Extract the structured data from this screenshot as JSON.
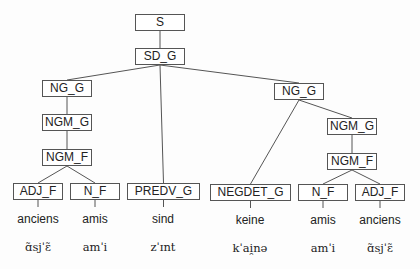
{
  "nodes": {
    "s": "S",
    "sd_g": "SD_G",
    "ng_g_left": "NG_G",
    "ngm_g_left": "NGM_G",
    "ngm_f_left": "NGM_F",
    "adj_f_left": "ADJ_F",
    "n_f_left": "N_F",
    "predv_g": "PREDV_G",
    "ng_g_right": "NG_G",
    "negdet_g": "NEGDET_G",
    "ngm_g_right": "NGM_G",
    "ngm_f_right": "NGM_F",
    "n_f_right": "N_F",
    "adj_f_right": "ADJ_F"
  },
  "words": {
    "w1": "anciens",
    "w2": "amis",
    "w3": "sind",
    "w4": "keine",
    "w5": "amis",
    "w6": "anciens"
  },
  "ipa": {
    "p1": "ɑ̃sjˈɛ̃",
    "p2": "amˈi",
    "p3": "zˈɪnt",
    "p4": "kˈai̯nə",
    "p5": "amˈi",
    "p6": "ɑ̃sjˈɛ̃"
  },
  "edges": [
    [
      "s",
      "sd_g"
    ],
    [
      "sd_g",
      "ng_g_left"
    ],
    [
      "sd_g",
      "predv_g"
    ],
    [
      "sd_g",
      "ng_g_right"
    ],
    [
      "ng_g_left",
      "ngm_g_left"
    ],
    [
      "ngm_g_left",
      "ngm_f_left"
    ],
    [
      "ngm_f_left",
      "adj_f_left"
    ],
    [
      "ngm_f_left",
      "n_f_left"
    ],
    [
      "ng_g_right",
      "negdet_g"
    ],
    [
      "ng_g_right",
      "ngm_g_right"
    ],
    [
      "ngm_g_right",
      "ngm_f_right"
    ],
    [
      "ngm_f_right",
      "n_f_right"
    ],
    [
      "ngm_f_right",
      "adj_f_right"
    ],
    [
      "adj_f_left",
      "w1"
    ],
    [
      "n_f_left",
      "w2"
    ],
    [
      "predv_g",
      "w3"
    ],
    [
      "negdet_g",
      "w4"
    ],
    [
      "n_f_right",
      "w5"
    ],
    [
      "adj_f_right",
      "w6"
    ]
  ]
}
